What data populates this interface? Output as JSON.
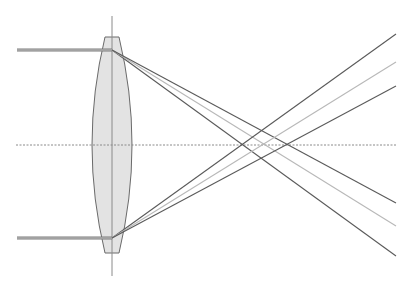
{
  "diagram": {
    "title": "",
    "type": "spherical-aberration-lens-ray-diagram",
    "colors": {
      "background": "#ffffff",
      "lens_fill": "#e3e3e3",
      "lens_stroke": "#6a6a6a",
      "axis": "#8a8a8a",
      "incoming_ray": "#7a7a7a",
      "ray_dark": "#5a5a5a",
      "ray_light": "#b8b8b8"
    },
    "optical_axis": {
      "y": 145,
      "x1": 16,
      "x2": 396,
      "style": "dotted"
    },
    "lens_axis": {
      "x": 112,
      "y1": 16,
      "y2": 276
    },
    "lens": {
      "center_x": 112,
      "top_y": 37,
      "bottom_y": 253,
      "flat_half_width": 7,
      "max_half_width": 20
    },
    "incoming_rays": [
      {
        "name": "upper",
        "y": 50,
        "x1": 17,
        "x2": 112
      },
      {
        "name": "lower",
        "y": 238,
        "x1": 17,
        "x2": 112
      }
    ],
    "refracted_rays": [
      {
        "name": "upper-dark-1",
        "from": [
          112,
          50
        ],
        "to": [
          396,
          256
        ],
        "color": "dark"
      },
      {
        "name": "upper-light",
        "from": [
          112,
          50
        ],
        "to": [
          396,
          226
        ],
        "color": "light"
      },
      {
        "name": "upper-dark-2",
        "from": [
          112,
          50
        ],
        "to": [
          396,
          203
        ],
        "color": "dark"
      },
      {
        "name": "lower-dark-1",
        "from": [
          112,
          238
        ],
        "to": [
          396,
          34
        ],
        "color": "dark"
      },
      {
        "name": "lower-light",
        "from": [
          112,
          238
        ],
        "to": [
          396,
          62
        ],
        "color": "light"
      },
      {
        "name": "lower-dark-2",
        "from": [
          112,
          238
        ],
        "to": [
          396,
          86
        ],
        "color": "dark"
      }
    ]
  }
}
